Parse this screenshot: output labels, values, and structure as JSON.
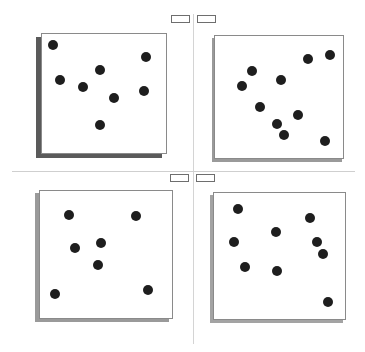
{
  "layout": {
    "tabs": [
      {
        "name": "tab-top-left",
        "x": 171,
        "y": 15
      },
      {
        "name": "tab-top-right",
        "x": 197,
        "y": 15
      },
      {
        "name": "tab-bottom-left",
        "x": 170,
        "y": 174
      },
      {
        "name": "tab-bottom-right",
        "x": 196,
        "y": 174
      }
    ]
  },
  "panels": [
    {
      "name": "panel-top-left",
      "x": 41,
      "y": 33,
      "w": 126,
      "h": 121,
      "shadow": {
        "dx": -5,
        "dy": 4,
        "color": "#5a5a5a"
      },
      "dots": [
        [
          53,
          45
        ],
        [
          146,
          57
        ],
        [
          100,
          70
        ],
        [
          60,
          80
        ],
        [
          83,
          87
        ],
        [
          114,
          98
        ],
        [
          144,
          91
        ],
        [
          100,
          125
        ]
      ]
    },
    {
      "name": "panel-top-right",
      "x": 214,
      "y": 35,
      "w": 130,
      "h": 124,
      "shadow": {
        "dx": -2,
        "dy": 3,
        "color": "#9a9a9a"
      },
      "dots": [
        [
          330,
          55
        ],
        [
          308,
          59
        ],
        [
          252,
          71
        ],
        [
          281,
          80
        ],
        [
          242,
          86
        ],
        [
          260,
          107
        ],
        [
          298,
          115
        ],
        [
          277,
          124
        ],
        [
          284,
          135
        ],
        [
          325,
          141
        ]
      ]
    },
    {
      "name": "panel-bottom-left",
      "x": 39,
      "y": 190,
      "w": 134,
      "h": 129,
      "shadow": {
        "dx": -4,
        "dy": 3,
        "color": "#9a9a9a"
      },
      "dots": [
        [
          69,
          215
        ],
        [
          136,
          216
        ],
        [
          101,
          243
        ],
        [
          75,
          248
        ],
        [
          98,
          265
        ],
        [
          55,
          294
        ],
        [
          148,
          290
        ]
      ]
    },
    {
      "name": "panel-bottom-right",
      "x": 213,
      "y": 192,
      "w": 133,
      "h": 128,
      "shadow": {
        "dx": -3,
        "dy": 3,
        "color": "#a3a3a3"
      },
      "dots": [
        [
          238,
          209
        ],
        [
          310,
          218
        ],
        [
          276,
          232
        ],
        [
          317,
          242
        ],
        [
          234,
          242
        ],
        [
          323,
          254
        ],
        [
          245,
          267
        ],
        [
          277,
          271
        ],
        [
          328,
          302
        ]
      ]
    }
  ]
}
